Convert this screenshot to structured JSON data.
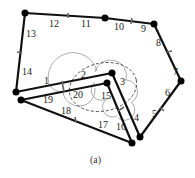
{
  "figure": {
    "caption": "(a)",
    "colors": {
      "stroke": "#111111",
      "thin": "#777777",
      "dashed": "#333333",
      "tick": "#666666"
    },
    "vertices": [
      {
        "id": "A",
        "x": 25,
        "y": 13
      },
      {
        "id": "B",
        "x": 105,
        "y": 18
      },
      {
        "id": "C",
        "x": 154,
        "y": 24
      },
      {
        "id": "D",
        "x": 181,
        "y": 81
      },
      {
        "id": "E",
        "x": 140,
        "y": 137
      },
      {
        "id": "F",
        "x": 112,
        "y": 73
      },
      {
        "id": "G",
        "x": 107,
        "y": 83
      },
      {
        "id": "H",
        "x": 132,
        "y": 143
      },
      {
        "id": "I",
        "x": 16,
        "y": 92
      },
      {
        "id": "J",
        "x": 21,
        "y": 100
      }
    ],
    "edge_labels": [
      {
        "text": "1",
        "x": 44,
        "y": 84
      },
      {
        "text": "2",
        "x": 81,
        "y": 78
      },
      {
        "text": "3",
        "x": 120,
        "y": 85
      },
      {
        "text": "4",
        "x": 134,
        "y": 121
      },
      {
        "text": "5",
        "x": 152,
        "y": 117
      },
      {
        "text": "6",
        "x": 165,
        "y": 96
      },
      {
        "text": "7",
        "x": 173,
        "y": 75
      },
      {
        "text": "8",
        "x": 156,
        "y": 46
      },
      {
        "text": "9",
        "x": 141,
        "y": 32
      },
      {
        "text": "10",
        "x": 114,
        "y": 30
      },
      {
        "text": "11",
        "x": 81,
        "y": 27
      },
      {
        "text": "12",
        "x": 49,
        "y": 27
      },
      {
        "text": "13",
        "x": 26,
        "y": 37
      },
      {
        "text": "14",
        "x": 22,
        "y": 75
      },
      {
        "text": "15",
        "x": 101,
        "y": 99
      },
      {
        "text": "16",
        "x": 116,
        "y": 130
      },
      {
        "text": "17",
        "x": 98,
        "y": 128
      },
      {
        "text": "18",
        "x": 61,
        "y": 114
      },
      {
        "text": "19",
        "x": 43,
        "y": 103
      },
      {
        "text": "20",
        "x": 73,
        "y": 98
      }
    ]
  }
}
